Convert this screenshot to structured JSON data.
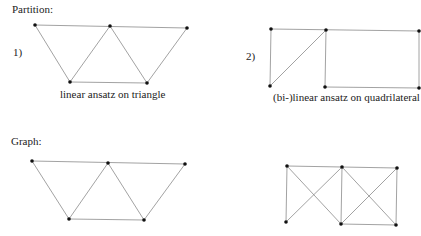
{
  "sections": {
    "partition": {
      "title": "Partition:"
    },
    "graph": {
      "title": "Graph:"
    }
  },
  "diagrams": {
    "p1": {
      "number": "1)",
      "caption": "linear ansatz on triangle"
    },
    "p2": {
      "number": "2)",
      "caption": "(bi-)linear ansatz on quadrilateral"
    }
  },
  "colors": {
    "edge": "#8a8a8a",
    "node": "#111111"
  }
}
